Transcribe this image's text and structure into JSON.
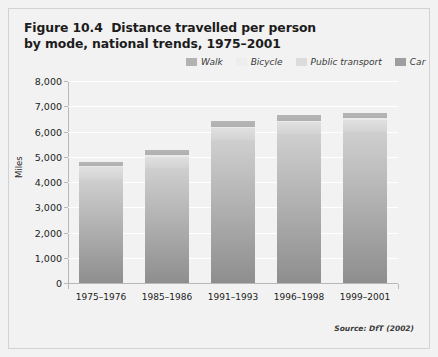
{
  "figure": {
    "title_line1": "Figure 10.4  Distance travelled per person",
    "title_line2": "by mode, national trends, 1975–2001",
    "source": "Source: DfT (2002)",
    "background_color": "#f2f2f2",
    "border_color": "#d2d2d2"
  },
  "chart_data": {
    "type": "bar",
    "stacked": true,
    "title": "Figure 10.4  Distance travelled per person by mode, national trends, 1975–2001",
    "xlabel": "",
    "ylabel": "Miles",
    "ylim": [
      0,
      8000
    ],
    "ytick_step": 1000,
    "yticks": [
      "0",
      "1,000",
      "2,000",
      "3,000",
      "4,000",
      "5,000",
      "6,000",
      "7,000",
      "8,000"
    ],
    "grid": true,
    "grid_color": "#ffffff",
    "legend_position": "top-right",
    "categories": [
      "1975–1976",
      "1985–1986",
      "1991–1993",
      "1996–1998",
      "1999–2001"
    ],
    "series": [
      {
        "name": "Car",
        "color": "#a8a8a8",
        "values": [
          4100,
          4550,
          5650,
          5900,
          6000
        ]
      },
      {
        "name": "Public transport",
        "color": "#dcdcdc",
        "values": [
          480,
          460,
          500,
          490,
          475
        ]
      },
      {
        "name": "Bicycle",
        "color": "#eaeaea",
        "values": [
          60,
          50,
          45,
          45,
          45
        ]
      },
      {
        "name": "Walk",
        "color": "#b2b2b2",
        "values": [
          160,
          190,
          205,
          215,
          230
        ]
      }
    ],
    "totals": [
      4800,
      5250,
      6400,
      6650,
      6750
    ],
    "annotations": [
      "Source: DfT (2002)"
    ]
  },
  "legend": {
    "items": [
      {
        "label": "Walk",
        "color": "#b2b2b2"
      },
      {
        "label": "Bicycle",
        "color": "#ededed"
      },
      {
        "label": "Public transport",
        "color": "#dcdcdc"
      },
      {
        "label": "Car",
        "color": "#9e9e9e"
      }
    ]
  }
}
